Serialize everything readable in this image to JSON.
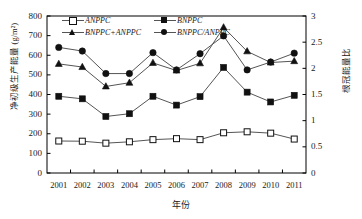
{
  "chart_data": {
    "type": "line",
    "title": "",
    "xlabel": "年份",
    "ylabel": "净初级生产能量 (g/m²)",
    "ylabel_right": "根冠能量比",
    "categories": [
      "2001",
      "2002",
      "2003",
      "2004",
      "2005",
      "2006",
      "2007",
      "2008",
      "2009",
      "2010",
      "2011"
    ],
    "ylim": [
      0,
      800
    ],
    "ylim_right": [
      0,
      3
    ],
    "yticks": [
      "0",
      "100",
      "200",
      "300",
      "400",
      "500",
      "600",
      "700",
      "800"
    ],
    "yticks_right": [
      "0",
      "0.5",
      "1",
      "1.5",
      "2",
      "2.5",
      "3"
    ],
    "grid": false,
    "legend_position": "top-left-inside",
    "series": [
      {
        "name": "ANPPC",
        "axis": "left",
        "marker": "open-square",
        "values": [
          163,
          162,
          152,
          159,
          170,
          175,
          170,
          205,
          210,
          203,
          173
        ]
      },
      {
        "name": "BNPPC",
        "axis": "left",
        "marker": "filled-square",
        "values": [
          391,
          378,
          288,
          302,
          391,
          346,
          389,
          538,
          412,
          362,
          396
        ]
      },
      {
        "name": "BNPPC+ANPPC",
        "axis": "left",
        "marker": "filled-triangle",
        "values": [
          556,
          540,
          441,
          460,
          561,
          522,
          559,
          742,
          620,
          563,
          570
        ]
      },
      {
        "name": "BNPPC/ANPPC",
        "axis": "right",
        "marker": "filled-circle",
        "values": [
          2.4,
          2.33,
          1.9,
          1.9,
          2.3,
          1.97,
          2.28,
          2.62,
          1.97,
          2.12,
          2.29
        ]
      }
    ]
  },
  "legend": {
    "items": [
      {
        "label": "ANPPC"
      },
      {
        "label": "BNPPC"
      },
      {
        "label": "BNPPC+ANPPC"
      },
      {
        "label": "BNPPC/ANPPC"
      }
    ]
  },
  "colors": {
    "line": "#555555",
    "marker": "#111111",
    "axis": "#000000",
    "text": "#1a1a1a",
    "background": "#ffffff"
  }
}
